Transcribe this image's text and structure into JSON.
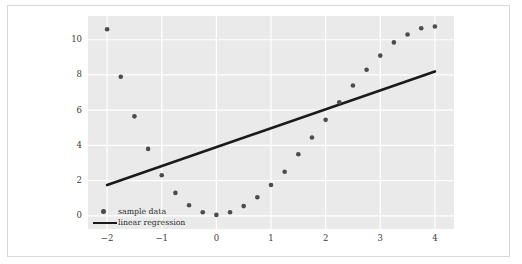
{
  "chart_data": {
    "type": "scatter",
    "title": "",
    "xlabel": "",
    "ylabel": "",
    "xlim": [
      -2.35,
      4.35
    ],
    "ylim": [
      -0.75,
      11.35
    ],
    "grid": true,
    "grid_color": "#ffffff",
    "plot_background": "#eaeaea",
    "figure_background": "#ffffff",
    "xticks": [
      -2,
      -1,
      0,
      1,
      2,
      3,
      4
    ],
    "xtick_labels": [
      "−2",
      "−1",
      "0",
      "1",
      "2",
      "3",
      "4"
    ],
    "yticks": [
      0,
      2,
      4,
      6,
      8,
      10
    ],
    "ytick_labels": [
      "0",
      "2",
      "4",
      "6",
      "8",
      "10"
    ],
    "legend_position": "lower left",
    "series": [
      {
        "name": "sample data",
        "type": "scatter",
        "color": "#4c4c4c",
        "marker": "circle",
        "marker_size": 4.6,
        "x": [
          -2.0,
          -1.75,
          -1.5,
          -1.25,
          -1.0,
          -0.75,
          -0.5,
          -0.25,
          0.0,
          0.25,
          0.5,
          0.75,
          1.0,
          1.25,
          1.5,
          1.75,
          2.0,
          2.25,
          2.5,
          2.75,
          3.0,
          3.25,
          3.5,
          3.75,
          4.0
        ],
        "y": [
          10.6,
          7.9,
          5.65,
          3.8,
          2.3,
          1.3,
          0.6,
          0.2,
          0.05,
          0.2,
          0.55,
          1.05,
          1.75,
          2.5,
          3.5,
          4.45,
          5.45,
          6.45,
          7.4,
          8.3,
          9.1,
          9.85,
          10.3,
          10.65,
          10.75
        ]
      },
      {
        "name": "linear regression",
        "type": "line",
        "color": "#1a1a1a",
        "line_width": 2.6,
        "x": [
          -2.0,
          4.0
        ],
        "y": [
          1.75,
          8.2
        ]
      }
    ]
  },
  "legend": {
    "items": [
      {
        "label": "sample data",
        "key": "marker"
      },
      {
        "label": "linear regression",
        "key": "line"
      }
    ]
  }
}
